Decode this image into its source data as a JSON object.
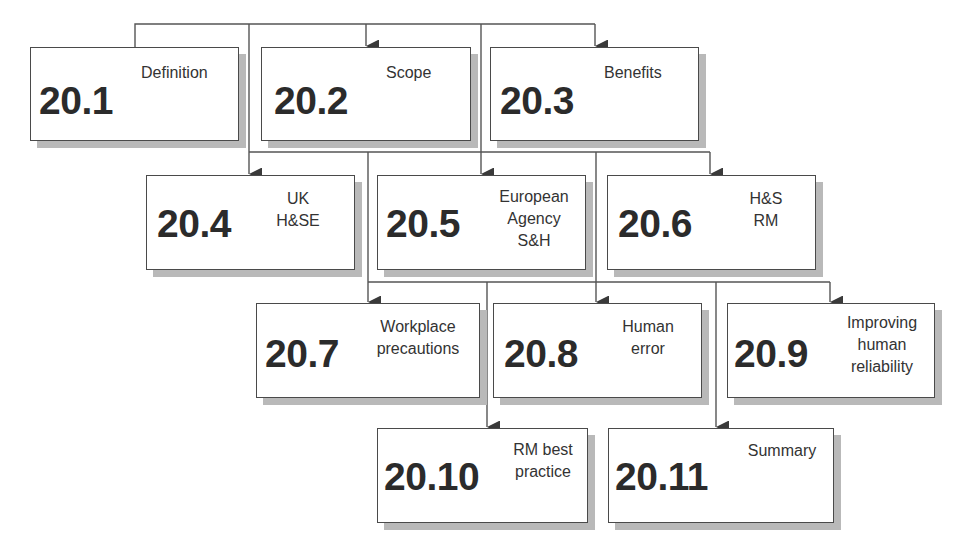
{
  "diagram": {
    "type": "hierarchy-flowchart",
    "colors": {
      "box_border": "#4a4a4a",
      "box_shadow": "#b9b9b9",
      "line": "#555555",
      "text": "#2b2b2b"
    },
    "nodes": [
      {
        "id": "20.1",
        "number": "20.1",
        "lines": [
          "Definition"
        ]
      },
      {
        "id": "20.2",
        "number": "20.2",
        "lines": [
          "Scope"
        ]
      },
      {
        "id": "20.3",
        "number": "20.3",
        "lines": [
          "Benefits"
        ]
      },
      {
        "id": "20.4",
        "number": "20.4",
        "lines": [
          "UK",
          "H&SE"
        ]
      },
      {
        "id": "20.5",
        "number": "20.5",
        "lines": [
          "European",
          "Agency",
          "S&H"
        ]
      },
      {
        "id": "20.6",
        "number": "20.6",
        "lines": [
          "H&S",
          "RM"
        ]
      },
      {
        "id": "20.7",
        "number": "20.7",
        "lines": [
          "Workplace",
          "precautions"
        ]
      },
      {
        "id": "20.8",
        "number": "20.8",
        "lines": [
          "Human",
          "error"
        ]
      },
      {
        "id": "20.9",
        "number": "20.9",
        "lines": [
          "Improving",
          "human",
          "reliability"
        ]
      },
      {
        "id": "20.10",
        "number": "20.10",
        "lines": [
          "RM best",
          "practice"
        ]
      },
      {
        "id": "20.11",
        "number": "20.11",
        "lines": [
          "Summary"
        ]
      }
    ],
    "edges": [
      {
        "from": "20.1",
        "to": "20.2"
      },
      {
        "from": "20.1",
        "to": "20.3"
      },
      {
        "from": "20.1",
        "to": "20.4"
      },
      {
        "from": "20.2",
        "to": "20.5"
      },
      {
        "from": "20.2",
        "to": "20.6"
      },
      {
        "from": "20.2",
        "to": "20.7"
      },
      {
        "from": "20.3",
        "to": "20.8"
      },
      {
        "from": "20.3",
        "to": "20.9"
      },
      {
        "from": "20.5",
        "to": "20.10"
      },
      {
        "from": "20.6",
        "to": "20.11"
      }
    ]
  }
}
